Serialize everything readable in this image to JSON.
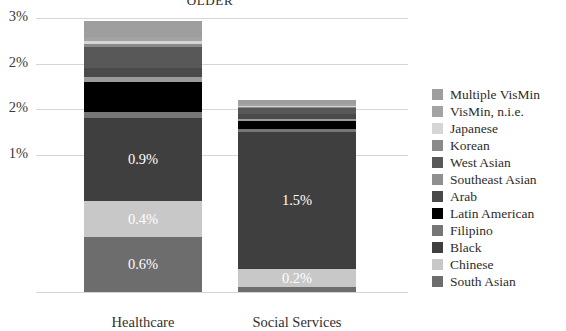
{
  "chart_data": {
    "type": "bar",
    "title": "OLDER",
    "xlabel": "",
    "ylabel": "",
    "categories": [
      "Healthcare",
      "Social Services"
    ],
    "ylim": [
      0,
      3.0
    ],
    "yticks": [
      1.5,
      2.0,
      2.5,
      3.0
    ],
    "ytick_labels": [
      "1%",
      "2%",
      "2%",
      "3%"
    ],
    "grid": true,
    "stacked": true,
    "legend_position": "right",
    "series": [
      {
        "name": "South Asian",
        "color": "#6d6d6d",
        "values": [
          0.6,
          0.05
        ],
        "labels": [
          "0.6%",
          ""
        ]
      },
      {
        "name": "Chinese",
        "color": "#c8c8c8",
        "values": [
          0.4,
          0.2
        ],
        "labels": [
          "0.4%",
          "0.2%"
        ]
      },
      {
        "name": "Black",
        "color": "#3f3f3f",
        "values": [
          0.9,
          1.5
        ],
        "labels": [
          "0.9%",
          "1.5%"
        ]
      },
      {
        "name": "Filipino",
        "color": "#767676",
        "values": [
          0.07,
          0.04
        ],
        "labels": [
          "",
          ""
        ]
      },
      {
        "name": "Latin American",
        "color": "#000000",
        "values": [
          0.33,
          0.08
        ],
        "labels": [
          "",
          ""
        ]
      },
      {
        "name": "Arab",
        "color": "#9b9b9b",
        "values": [
          0.05,
          0.03
        ],
        "labels": [
          "",
          ""
        ]
      },
      {
        "name": "Southeast Asian",
        "color": "#4a4a4a",
        "values": [
          0.1,
          0.05
        ],
        "labels": [
          "",
          ""
        ]
      },
      {
        "name": "West Asian",
        "color": "#585858",
        "values": [
          0.23,
          0.06
        ],
        "labels": [
          "",
          ""
        ]
      },
      {
        "name": "Korean",
        "color": "#8a8a8a",
        "values": [
          0.04,
          0.02
        ],
        "labels": [
          "",
          ""
        ]
      },
      {
        "name": "Japanese",
        "color": "#d5d5d5",
        "values": [
          0.03,
          0.01
        ],
        "labels": [
          "",
          ""
        ]
      },
      {
        "name": "VisMin, n.i.e.",
        "color": "#a3a3a3",
        "values": [
          0.04,
          0.02
        ],
        "labels": [
          "",
          ""
        ]
      },
      {
        "name": "Multiple VisMin",
        "color": "#9e9e9e",
        "values": [
          0.18,
          0.04
        ],
        "labels": [
          "",
          ""
        ]
      }
    ],
    "totals": [
      2.77,
      2.1
    ]
  },
  "legend": {
    "items": [
      {
        "label": "Multiple VisMin",
        "color": "#9e9e9e"
      },
      {
        "label": "VisMin, n.i.e.",
        "color": "#a3a3a3"
      },
      {
        "label": "Japanese",
        "color": "#d5d5d5"
      },
      {
        "label": "Korean",
        "color": "#8a8a8a"
      },
      {
        "label": "West Asian",
        "color": "#585858"
      },
      {
        "label": "Southeast Asian",
        "color": "#8f8f8f"
      },
      {
        "label": "Arab",
        "color": "#4a4a4a"
      },
      {
        "label": "Latin American",
        "color": "#000000"
      },
      {
        "label": "Filipino",
        "color": "#767676"
      },
      {
        "label": "Black",
        "color": "#3f3f3f"
      },
      {
        "label": "Chinese",
        "color": "#c8c8c8"
      },
      {
        "label": "South Asian",
        "color": "#6d6d6d"
      }
    ]
  }
}
